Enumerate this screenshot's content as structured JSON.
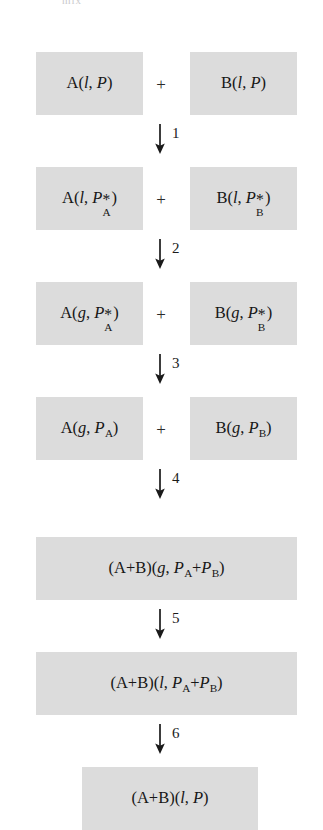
{
  "diagram": {
    "title_fragment": "mix",
    "type": "thermodynamic-cycle",
    "box_fill_color": "#dcdcdc",
    "text_color": "#171717",
    "plus_symbol": "+",
    "rows": [
      {
        "id": "row-1",
        "layout": "pair",
        "left": {
          "species": "A",
          "phase": "l",
          "pressure": "P",
          "label": "A(l, P)"
        },
        "right": {
          "species": "B",
          "phase": "l",
          "pressure": "P",
          "label": "B(l, P)"
        }
      },
      {
        "id": "row-2",
        "layout": "pair",
        "left": {
          "species": "A",
          "phase": "l",
          "pressure": "P*A",
          "label": "A(l, P*A)"
        },
        "right": {
          "species": "B",
          "phase": "l",
          "pressure": "P*B",
          "label": "B(l, P*B)"
        }
      },
      {
        "id": "row-3",
        "layout": "pair",
        "left": {
          "species": "A",
          "phase": "g",
          "pressure": "P*A",
          "label": "A(g, P*A)"
        },
        "right": {
          "species": "B",
          "phase": "g",
          "pressure": "P*B",
          "label": "B(g, P*B)"
        }
      },
      {
        "id": "row-4",
        "layout": "pair",
        "left": {
          "species": "A",
          "phase": "g",
          "pressure": "PA",
          "label": "A(g, PA)"
        },
        "right": {
          "species": "B",
          "phase": "g",
          "pressure": "PB",
          "label": "B(g, PB)"
        }
      },
      {
        "id": "row-5",
        "layout": "wide",
        "single": {
          "species": "(A+B)",
          "phase": "g",
          "pressure": "PA+PB",
          "label": "(A+B)(g, PA+PB)"
        }
      },
      {
        "id": "row-6",
        "layout": "wide",
        "single": {
          "species": "(A+B)",
          "phase": "l",
          "pressure": "PA+PB",
          "label": "(A+B)(l, PA+PB)"
        }
      },
      {
        "id": "row-7",
        "layout": "narrow",
        "single": {
          "species": "(A+B)",
          "phase": "l",
          "pressure": "P",
          "label": "(A+B)(l, P)"
        }
      }
    ],
    "steps": [
      {
        "number": "1",
        "icon": "down-arrow-icon"
      },
      {
        "number": "2",
        "icon": "down-arrow-icon"
      },
      {
        "number": "3",
        "icon": "down-arrow-icon"
      },
      {
        "number": "4",
        "icon": "down-arrow-icon"
      },
      {
        "number": "5",
        "icon": "down-arrow-icon"
      },
      {
        "number": "6",
        "icon": "down-arrow-icon"
      }
    ],
    "symbols": {
      "liquid": "l",
      "gas": "g",
      "pressure": "P",
      "species_a": "A",
      "species_b": "B",
      "asterisk": "*"
    }
  }
}
